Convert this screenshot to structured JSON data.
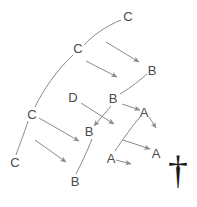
{
  "diagram": {
    "type": "lineage-tree",
    "background_color": "#ffffff",
    "line_color": "#8a8a8a",
    "label_color": "#4a4a4a",
    "nodes": [
      {
        "id": "c-top",
        "label": "C",
        "x": 128,
        "y": 16
      },
      {
        "id": "c-upper",
        "label": "C",
        "x": 78,
        "y": 48
      },
      {
        "id": "b-upper-right",
        "label": "B",
        "x": 152,
        "y": 70
      },
      {
        "id": "d-middle",
        "label": "D",
        "x": 73,
        "y": 97
      },
      {
        "id": "b-middle",
        "label": "B",
        "x": 113,
        "y": 98
      },
      {
        "id": "c-left",
        "label": "C",
        "x": 32,
        "y": 114
      },
      {
        "id": "a-upper",
        "label": "A",
        "x": 144,
        "y": 112
      },
      {
        "id": "b-lower-mid",
        "label": "B",
        "x": 89,
        "y": 131
      },
      {
        "id": "a-right",
        "label": "A",
        "x": 156,
        "y": 153
      },
      {
        "id": "a-lower",
        "label": "A",
        "x": 111,
        "y": 158
      },
      {
        "id": "c-bottom",
        "label": "C",
        "x": 15,
        "y": 162
      },
      {
        "id": "b-bottom",
        "label": "B",
        "x": 75,
        "y": 181
      }
    ],
    "curves": [
      {
        "id": "curve-c-top-to-c-upper",
        "d": "M 121 20 C 106 26 92 36 84 45"
      },
      {
        "id": "curve-c-upper-to-c-left",
        "d": "M 73 55 C 57 70 43 90 35 107"
      },
      {
        "id": "curve-c-left-to-c-bottom",
        "d": "M 28 121 C 24 134 19 146 16 155"
      },
      {
        "id": "curve-b-middle-to-b-upper",
        "d": "M 120 94 C 132 87 141 79 147 74"
      },
      {
        "id": "curve-b-lower-to-b-bottom",
        "d": "M 92 139 C 87 152 80 166 76 174"
      },
      {
        "id": "curve-a-lower-to-a-upper",
        "d": "M 115 151 C 123 139 134 124 140 117"
      }
    ],
    "arrows": [
      {
        "id": "arrow-c-upper-to-b-upper-right",
        "x1": 106,
        "y1": 42,
        "x2": 139,
        "y2": 62
      },
      {
        "id": "arrow-c-upper-to-b-middle",
        "x1": 86,
        "y1": 61,
        "x2": 117,
        "y2": 77
      },
      {
        "id": "arrow-d-to-right",
        "x1": 81,
        "y1": 103,
        "x2": 114,
        "y2": 124
      },
      {
        "id": "arrow-b-middle-to-down-left",
        "x1": 111,
        "y1": 106,
        "x2": 94,
        "y2": 126
      },
      {
        "id": "arrow-b-middle-to-a-upper",
        "x1": 122,
        "y1": 104,
        "x2": 140,
        "y2": 110
      },
      {
        "id": "arrow-a-upper-to-down-right",
        "x1": 149,
        "y1": 117,
        "x2": 156,
        "y2": 128
      },
      {
        "id": "arrow-c-left-to-b-lower",
        "x1": 39,
        "y1": 118,
        "x2": 79,
        "y2": 141
      },
      {
        "id": "arrow-left-to-lower",
        "x1": 35,
        "y1": 140,
        "x2": 66,
        "y2": 162
      },
      {
        "id": "arrow-mid-to-a-right",
        "x1": 123,
        "y1": 140,
        "x2": 150,
        "y2": 149
      },
      {
        "id": "arrow-a-lower-to-right",
        "x1": 116,
        "y1": 160,
        "x2": 131,
        "y2": 164
      }
    ],
    "cross": {
      "id": "cross-symbol",
      "glyph": "†",
      "x": 178,
      "y": 170
    }
  }
}
